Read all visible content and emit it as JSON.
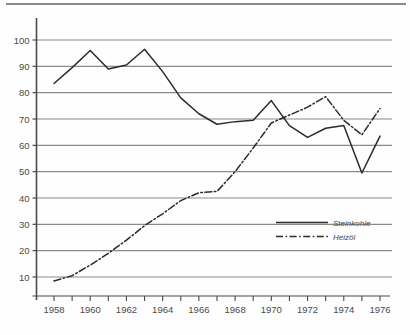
{
  "figure": {
    "background_color": "#fefefe",
    "axis_color": "#4a4a4a",
    "grid_color": "#8a8a8a",
    "series_color": "#2b2b2b"
  },
  "chart_data": {
    "type": "line",
    "title": "",
    "subtitle": "",
    "xlabel": "",
    "ylabel": "",
    "xlim": [
      1957.5,
      1976.8
    ],
    "ylim": [
      0,
      107
    ],
    "grid": true,
    "grid_axis": "y",
    "legend_position": "inside-bottom-right",
    "x": [
      1958,
      1959,
      1960,
      1961,
      1962,
      1963,
      1964,
      1965,
      1966,
      1967,
      1968,
      1969,
      1970,
      1971,
      1972,
      1973,
      1974,
      1975,
      1976
    ],
    "x_tick_values": [
      1958,
      1959,
      1960,
      1961,
      1962,
      1963,
      1964,
      1965,
      1966,
      1967,
      1968,
      1969,
      1970,
      1971,
      1972,
      1973,
      1974,
      1975,
      1976
    ],
    "x_tick_labels": [
      "1958",
      "",
      "1960",
      "",
      "1962",
      "",
      "1964",
      "",
      "1966",
      "",
      "1968",
      "",
      "1970",
      "",
      "1972",
      "",
      "1974",
      "",
      "1976"
    ],
    "y_tick_values": [
      10,
      20,
      30,
      40,
      50,
      60,
      70,
      80,
      90,
      100
    ],
    "y_tick_labels": [
      "10",
      "20",
      "30",
      "40",
      "50",
      "60",
      "70",
      "80",
      "90",
      "100"
    ],
    "series": [
      {
        "name": "Steinkohle",
        "style": "solid",
        "color": "#2b2b2b",
        "values": [
          83.5,
          89.5,
          96.0,
          89.0,
          90.5,
          96.5,
          88.0,
          78.0,
          72.0,
          68.0,
          69.0,
          69.5,
          77.0,
          67.5,
          63.0,
          66.5,
          67.5,
          49.5,
          63.5
        ]
      },
      {
        "name": "Heizöl",
        "style": "dash-dot",
        "color": "#2b2b2b",
        "values": [
          8.5,
          10.5,
          14.5,
          19.0,
          24.0,
          29.5,
          34.0,
          39.0,
          42.0,
          42.5,
          50.0,
          59.0,
          68.5,
          71.5,
          74.5,
          78.5,
          69.5,
          64.0,
          74.0
        ]
      }
    ]
  },
  "legend": {
    "items": [
      {
        "label": "Steinkohle",
        "style": "solid"
      },
      {
        "label": "Heizöl",
        "style": "dash-dot"
      }
    ]
  }
}
